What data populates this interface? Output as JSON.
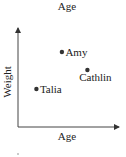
{
  "chart_data": {
    "type": "scatter",
    "title": "Age",
    "xlabel": "Age",
    "ylabel": "Weight",
    "xlim": [
      0,
      10
    ],
    "ylim": [
      0,
      10
    ],
    "grid": false,
    "ticks": false,
    "points": [
      {
        "label": "Amy",
        "x": 4.3,
        "y": 7.5,
        "label_position": "right"
      },
      {
        "label": "Cathlin",
        "x": 6.8,
        "y": 5.7,
        "label_position": "below"
      },
      {
        "label": "Talia",
        "x": 1.8,
        "y": 3.8,
        "label_position": "right"
      }
    ],
    "colors": {
      "axis": "#444444",
      "point": "#333333",
      "text": "#222222"
    }
  }
}
